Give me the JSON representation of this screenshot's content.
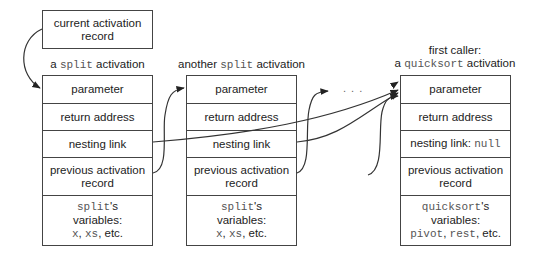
{
  "diagram": {
    "current_record": {
      "line1": "current activation",
      "line2": "record"
    },
    "stack_frames": [
      {
        "title_prefix": "a ",
        "title_code": "split",
        "title_suffix": " activation",
        "rows": {
          "parameter": "parameter",
          "return_address": "return address",
          "nesting_link": "nesting link",
          "previous_line1": "previous activation",
          "previous_line2": "record",
          "vars_code": "split",
          "vars_suffix": "'s",
          "vars_line2": "variables:",
          "vars_code_a": "x",
          "vars_sep1": ", ",
          "vars_code_b": "xs",
          "vars_tail": ", etc."
        }
      },
      {
        "title_prefix": "another ",
        "title_code": "split",
        "title_suffix": " activation",
        "rows": {
          "parameter": "parameter",
          "return_address": "return address",
          "nesting_link": "nesting link",
          "previous_line1": "previous activation",
          "previous_line2": "record",
          "vars_code": "split",
          "vars_suffix": "'s",
          "vars_line2": "variables:",
          "vars_code_a": "x",
          "vars_sep1": ", ",
          "vars_code_b": "xs",
          "vars_tail": ", etc."
        }
      },
      {
        "title_line1": "first caller:",
        "title_prefix": "a ",
        "title_code": "quicksort",
        "title_suffix": " activation",
        "rows": {
          "parameter": "parameter",
          "return_address": "return address",
          "nesting_link": "nesting link: ",
          "nesting_link_code": "null",
          "previous_line1": "previous activation",
          "previous_line2": "record",
          "vars_code": "quicksort",
          "vars_suffix": "'s",
          "vars_line2": "variables:",
          "vars_code_a": "pivot",
          "vars_sep1": ", ",
          "vars_code_b": "rest",
          "vars_tail": ", etc."
        }
      }
    ],
    "ellipsis": ". . .",
    "colors": {
      "line": "#444444",
      "code_text": "#555555",
      "text": "#222222"
    }
  }
}
